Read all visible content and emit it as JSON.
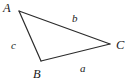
{
  "figure": {
    "type": "triangle-diagram",
    "background_color": "#ffffff",
    "stroke_color": "#2b2b2b",
    "stroke_width": 1.2,
    "width": 130,
    "height": 83,
    "vertices": [
      {
        "id": "A",
        "label": "A",
        "x": 19,
        "y": 11
      },
      {
        "id": "B",
        "label": "B",
        "x": 41,
        "y": 61
      },
      {
        "id": "C",
        "label": "C",
        "x": 110,
        "y": 44
      }
    ],
    "sides": [
      {
        "id": "a",
        "label": "a",
        "between": "B-C",
        "opposite_vertex": "A"
      },
      {
        "id": "b",
        "label": "b",
        "between": "A-C",
        "opposite_vertex": "B"
      },
      {
        "id": "c",
        "label": "c",
        "between": "A-B",
        "opposite_vertex": "C"
      }
    ]
  }
}
